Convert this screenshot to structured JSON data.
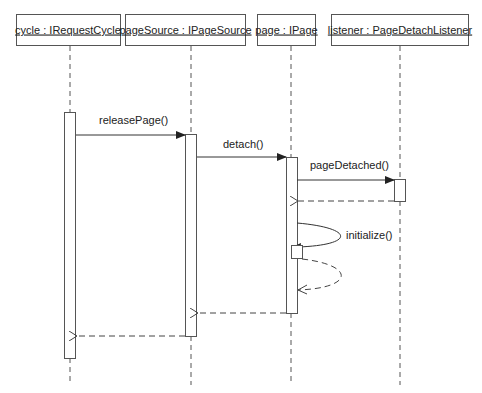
{
  "diagram": {
    "type": "UML sequence diagram",
    "colors": {
      "stroke": "#555555",
      "text": "#222222",
      "background": "#ffffff"
    },
    "participants": [
      {
        "id": "cycle",
        "label": "cycle : IRequestCycle",
        "box": [
          16,
          14,
          104,
          31
        ],
        "lifeline_x": 70
      },
      {
        "id": "pageSource",
        "label": "pageSource : IPageSource",
        "box": [
          125,
          14,
          120,
          31
        ],
        "lifeline_x": 190
      },
      {
        "id": "page",
        "label": "page : IPage",
        "box": [
          257,
          14,
          58,
          31
        ],
        "lifeline_x": 291
      },
      {
        "id": "listener",
        "label": "listener : PageDetachListener",
        "box": [
          331,
          14,
          137,
          31
        ],
        "lifeline_x": 400
      }
    ],
    "messages": [
      {
        "id": "m1",
        "label": "releasePage()",
        "from": "cycle",
        "to": "pageSource",
        "kind": "call"
      },
      {
        "id": "m2",
        "label": "detach()",
        "from": "pageSource",
        "to": "page",
        "kind": "call"
      },
      {
        "id": "m3",
        "label": "pageDetached()",
        "from": "page",
        "to": "listener",
        "kind": "call"
      },
      {
        "id": "m4",
        "label": "",
        "from": "listener",
        "to": "page",
        "kind": "return"
      },
      {
        "id": "m5",
        "label": "initialize()",
        "from": "page",
        "to": "page",
        "kind": "self-call"
      },
      {
        "id": "m6",
        "label": "",
        "from": "page",
        "to": "page",
        "kind": "self-return"
      },
      {
        "id": "m7",
        "label": "",
        "from": "page",
        "to": "pageSource",
        "kind": "return"
      },
      {
        "id": "m8",
        "label": "",
        "from": "pageSource",
        "to": "cycle",
        "kind": "return"
      }
    ]
  }
}
